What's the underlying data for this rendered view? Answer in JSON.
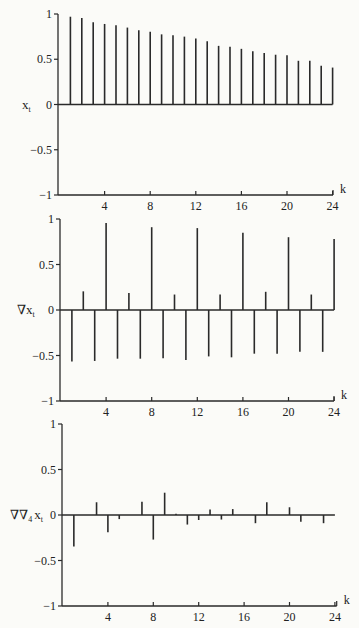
{
  "chart_data": [
    {
      "type": "bar",
      "subtype": "stem",
      "title": "",
      "ylabel": "x_t",
      "ylabel_display": {
        "main": "x",
        "sub": "t"
      },
      "xlabel": "k",
      "xlim": [
        0,
        24
      ],
      "ylim": [
        -1,
        1
      ],
      "xticks": [
        4,
        8,
        12,
        16,
        20,
        24
      ],
      "yticks": [
        1,
        0.5,
        0,
        -0.5,
        -1
      ],
      "ytick_labels": [
        "1",
        "0.5",
        "0",
        "−0.5",
        "−1"
      ],
      "grid": false,
      "x": [
        1,
        2,
        3,
        4,
        5,
        6,
        7,
        8,
        9,
        10,
        11,
        12,
        13,
        14,
        15,
        16,
        17,
        18,
        19,
        20,
        21,
        22,
        23,
        24
      ],
      "values": [
        0.97,
        0.955,
        0.91,
        0.89,
        0.877,
        0.85,
        0.82,
        0.805,
        0.775,
        0.764,
        0.75,
        0.73,
        0.7,
        0.648,
        0.637,
        0.615,
        0.588,
        0.57,
        0.55,
        0.543,
        0.483,
        0.483,
        0.427,
        0.408
      ]
    },
    {
      "type": "bar",
      "subtype": "stem",
      "title": "",
      "ylabel": "∇x_t",
      "ylabel_display": {
        "main": "∇x",
        "sub": "t"
      },
      "xlabel": "k",
      "xlim": [
        0,
        24
      ],
      "ylim": [
        -1,
        1
      ],
      "xticks": [
        4,
        8,
        12,
        16,
        20,
        24
      ],
      "yticks": [
        1,
        0.5,
        0,
        -0.5,
        -1
      ],
      "ytick_labels": [
        "1",
        "0.5",
        "0",
        "−0.5",
        "−1"
      ],
      "grid": false,
      "x": [
        1,
        2,
        3,
        4,
        5,
        6,
        7,
        8,
        9,
        10,
        11,
        12,
        13,
        14,
        15,
        16,
        17,
        18,
        19,
        20,
        21,
        22,
        23,
        24
      ],
      "values": [
        -0.565,
        0.205,
        -0.56,
        0.955,
        -0.535,
        0.187,
        -0.535,
        0.91,
        -0.53,
        0.17,
        -0.55,
        0.9,
        -0.51,
        0.17,
        -0.52,
        0.85,
        -0.48,
        0.2,
        -0.48,
        0.8,
        -0.46,
        0.17,
        -0.46,
        0.78
      ]
    },
    {
      "type": "bar",
      "subtype": "stem",
      "title": "",
      "ylabel": "∇∇_4 x_t",
      "ylabel_display": {
        "main": "∇∇",
        "sub": "4",
        "main2": "x",
        "sub2": "t"
      },
      "xlabel": "k",
      "xlim": [
        0,
        24
      ],
      "ylim": [
        -1,
        1
      ],
      "xticks": [
        4,
        8,
        12,
        16,
        20,
        24
      ],
      "yticks": [
        1,
        0.5,
        0,
        -0.5,
        -1
      ],
      "ytick_labels": [
        "1",
        "0.5",
        "0",
        "−0.5",
        "−1"
      ],
      "grid": false,
      "x": [
        1,
        2,
        3,
        4,
        5,
        6,
        7,
        8,
        9,
        10,
        11,
        12,
        13,
        14,
        15,
        16,
        17,
        18,
        19,
        20,
        21,
        22,
        23,
        24
      ],
      "values": [
        -0.345,
        0.0,
        0.14,
        -0.19,
        -0.045,
        0.0,
        0.145,
        -0.27,
        0.245,
        0.015,
        -0.105,
        -0.055,
        0.06,
        -0.05,
        0.065,
        0.0,
        -0.09,
        0.14,
        0.0,
        0.085,
        -0.075,
        0.0,
        -0.09,
        0.0
      ]
    }
  ],
  "layout": {
    "panels": [
      {
        "x0": 59.0,
        "dx": 11.4,
        "y0": 104.5,
        "scale": 90.5,
        "axis_x_start": 58,
        "axis_x_end": 333
      },
      {
        "x0": 60.5,
        "dx": 11.4,
        "y0": 310.0,
        "scale": 91.0,
        "axis_x_start": 60,
        "axis_x_end": 334
      },
      {
        "x0": 62.5,
        "dx": 11.35,
        "y0": 515.0,
        "scale": 91.0,
        "axis_x_start": 62,
        "axis_x_end": 336.7
      }
    ],
    "ink_color": "#2a2a2a",
    "background": "#fbfbf8"
  }
}
